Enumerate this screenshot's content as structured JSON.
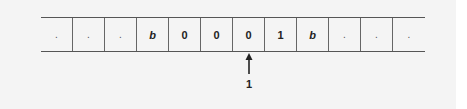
{
  "diagram": {
    "type": "turing-machine-tape",
    "tape": {
      "cells": [
        ".",
        ".",
        ".",
        "b",
        "0",
        "0",
        "0",
        "1",
        "b",
        ".",
        ".",
        "."
      ]
    },
    "head": {
      "position_index": 6,
      "label": "1"
    },
    "colors": {
      "background": "#f4f4f4",
      "lines": "#555555",
      "text": "#222222"
    }
  }
}
